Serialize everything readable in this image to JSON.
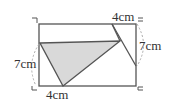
{
  "diagram": {
    "labels": {
      "top_segment": "4cm",
      "right_segment": "7cm",
      "left_segment": "7cm",
      "bottom_segment": "4cm"
    },
    "colors": {
      "line": "#555555",
      "fill": "#d9d9d9",
      "dash": "#aaaaaa"
    }
  }
}
